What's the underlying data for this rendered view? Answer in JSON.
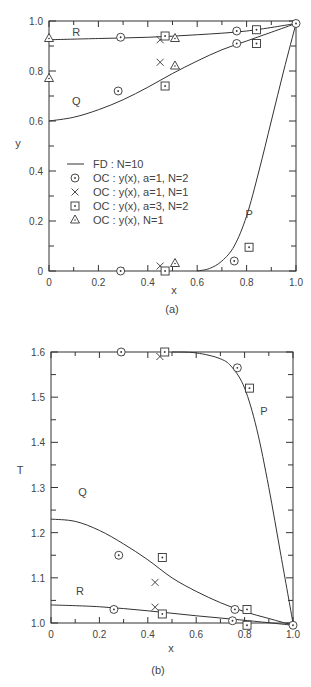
{
  "chart_data": [
    {
      "type": "line",
      "panel_label": "(a)",
      "xlabel": "x",
      "ylabel": "y",
      "xlim": [
        0,
        1.0
      ],
      "ylim": [
        0,
        1.0
      ],
      "x_ticks": [
        "0",
        "0.2",
        "0.4",
        "0.6",
        "0.8",
        "1.0"
      ],
      "y_ticks": [
        "0",
        "0.2",
        "0.4",
        "0.6",
        "0.8",
        "1.0"
      ],
      "grid": false,
      "legend_position": "center-left",
      "legend": [
        {
          "symbol": "line",
          "label": "FD : N=10"
        },
        {
          "symbol": "dotted-circle",
          "label": "OC : y(x), a=1, N=2"
        },
        {
          "symbol": "cross",
          "label": "OC : y(x), a=1, N=1"
        },
        {
          "symbol": "dotted-square",
          "label": "OC : y(x), a=3, N=2"
        },
        {
          "symbol": "triangle",
          "label": "OC : y(x),  N=1"
        }
      ],
      "curve_labels": [
        {
          "text": "R",
          "x": 0.11,
          "y": 0.955
        },
        {
          "text": "Q",
          "x": 0.11,
          "y": 0.68
        },
        {
          "text": "P",
          "x": 0.81,
          "y": 0.23
        }
      ],
      "series": [
        {
          "name": "FD : N=10 (R)",
          "kind": "line",
          "x": [
            0,
            0.2,
            0.4,
            0.6,
            0.8,
            1.0
          ],
          "y": [
            0.925,
            0.93,
            0.935,
            0.945,
            0.96,
            0.99
          ]
        },
        {
          "name": "FD : N=10 (Q)",
          "kind": "line",
          "x": [
            0,
            0.1,
            0.2,
            0.3,
            0.4,
            0.5,
            0.6,
            0.7,
            0.8,
            0.9,
            1.0
          ],
          "y": [
            0.6,
            0.615,
            0.645,
            0.685,
            0.735,
            0.79,
            0.84,
            0.885,
            0.92,
            0.955,
            0.99
          ]
        },
        {
          "name": "FD : N=10 (P)",
          "kind": "line",
          "x": [
            0.6,
            0.65,
            0.7,
            0.75,
            0.8,
            0.85,
            0.9,
            0.95,
            1.0
          ],
          "y": [
            0.0,
            0.01,
            0.04,
            0.1,
            0.22,
            0.4,
            0.6,
            0.8,
            0.99
          ]
        },
        {
          "name": "OC : y(x), a=1, N=2",
          "kind": "dotted-circle",
          "x": [
            0.29,
            0.76,
            0.76,
            0.28,
            0.75,
            0.29,
            1.0
          ],
          "y": [
            0.935,
            0.96,
            0.91,
            0.72,
            0.04,
            0.0,
            0.99
          ]
        },
        {
          "name": "OC : y(x), a=1, N=1",
          "kind": "cross",
          "x": [
            0.45,
            0.45,
            0.45
          ],
          "y": [
            0.925,
            0.835,
            0.02
          ]
        },
        {
          "name": "OC : y(x), a=3, N=2",
          "kind": "dotted-square",
          "x": [
            0.47,
            0.84,
            0.84,
            0.47,
            0.81,
            0.47
          ],
          "y": [
            0.94,
            0.965,
            0.91,
            0.74,
            0.095,
            0.0
          ]
        },
        {
          "name": "OC : y(x),  N=1",
          "kind": "triangle",
          "x": [
            0.0,
            0.51,
            0.0,
            0.51,
            0.51
          ],
          "y": [
            0.93,
            0.93,
            0.77,
            0.82,
            0.03
          ]
        }
      ]
    },
    {
      "type": "line",
      "panel_label": "(b)",
      "xlabel": "x",
      "ylabel": "T",
      "xlim": [
        0,
        1.0
      ],
      "ylim": [
        1.0,
        1.6
      ],
      "x_ticks": [
        "0",
        "0.2",
        "0.4",
        "0.6",
        "0.8",
        "1.0"
      ],
      "y_ticks": [
        "1.0",
        "1.1",
        "1.2",
        "1.3",
        "1.4",
        "1.5",
        "1.6"
      ],
      "grid": false,
      "curve_labels": [
        {
          "text": "P",
          "x": 0.88,
          "y": 1.47
        },
        {
          "text": "Q",
          "x": 0.13,
          "y": 1.29
        },
        {
          "text": "R",
          "x": 0.12,
          "y": 1.07
        }
      ],
      "series": [
        {
          "name": "FD : N=10 (P)",
          "kind": "line",
          "x": [
            0.5,
            0.6,
            0.7,
            0.75,
            0.8,
            0.85,
            0.9,
            0.95,
            1.0
          ],
          "y": [
            1.6,
            1.598,
            1.585,
            1.565,
            1.52,
            1.43,
            1.3,
            1.15,
            1.0
          ]
        },
        {
          "name": "FD : N=10 (Q)",
          "kind": "line",
          "x": [
            0,
            0.1,
            0.2,
            0.3,
            0.4,
            0.5,
            0.6,
            0.7,
            0.8,
            0.9,
            1.0
          ],
          "y": [
            1.23,
            1.225,
            1.205,
            1.175,
            1.14,
            1.1,
            1.07,
            1.045,
            1.025,
            1.01,
            0.995
          ]
        },
        {
          "name": "FD : N=10 (R)",
          "kind": "line",
          "x": [
            0,
            0.2,
            0.4,
            0.6,
            0.8,
            1.0
          ],
          "y": [
            1.04,
            1.036,
            1.027,
            1.016,
            1.006,
            0.995
          ]
        },
        {
          "name": "OC : y(x), a=1, N=2",
          "kind": "dotted-circle",
          "x": [
            0.29,
            0.77,
            0.28,
            0.76,
            0.26,
            0.75,
            1.0
          ],
          "y": [
            1.6,
            1.565,
            1.15,
            1.03,
            1.03,
            1.005,
            0.995
          ]
        },
        {
          "name": "OC : y(x), a=1, N=1",
          "kind": "cross",
          "x": [
            0.45,
            0.43,
            0.43
          ],
          "y": [
            1.59,
            1.09,
            1.035
          ]
        },
        {
          "name": "OC : y(x), a=3, N=2",
          "kind": "dotted-square",
          "x": [
            0.47,
            0.82,
            0.46,
            0.81,
            0.46,
            0.81
          ],
          "y": [
            1.6,
            1.52,
            1.145,
            1.03,
            1.02,
            0.995
          ]
        }
      ]
    }
  ],
  "panels": {
    "a": {
      "label": "(a)",
      "xlabel": "x",
      "ylabel": "y"
    },
    "b": {
      "label": "(b)",
      "xlabel": "x",
      "ylabel": "T"
    }
  }
}
